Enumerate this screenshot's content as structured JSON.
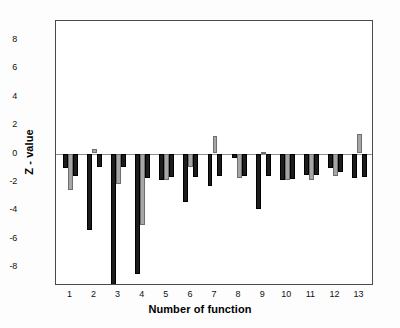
{
  "axes": {
    "xlabel": "Number of function",
    "ylabel": "Z - value",
    "yticks": [
      8,
      6,
      4,
      2,
      0,
      -2,
      -4,
      -6,
      -8
    ],
    "ytick_labels": [
      "8",
      "6",
      "4",
      "2",
      "0",
      "-2",
      "-4",
      "-6",
      "-8"
    ],
    "xticks": [
      1,
      2,
      3,
      4,
      5,
      6,
      7,
      8,
      9,
      10,
      11,
      12,
      13
    ],
    "xtick_labels": [
      "1",
      "2",
      "3",
      "4",
      "5",
      "6",
      "7",
      "8",
      "9",
      "10",
      "11",
      "12",
      "13"
    ]
  },
  "colors": {
    "series_1": "#1c1c1c",
    "series_2": "#a6a6a6",
    "series_3": "#1c1c1c",
    "axis": "#4a4a4a",
    "zero_line": "#8d8d8d",
    "background": "#ffffff"
  },
  "chart_data": {
    "type": "bar",
    "title": "",
    "xlabel": "Number of function",
    "ylabel": "Z - value",
    "categories": [
      "1",
      "2",
      "3",
      "4",
      "5",
      "6",
      "7",
      "8",
      "9",
      "10",
      "11",
      "12",
      "13"
    ],
    "ylim": [
      -9.3,
      9.3
    ],
    "xlim": [
      0.4,
      13.6
    ],
    "grid": false,
    "legend": "none",
    "zero_reference_line": 0,
    "series": [
      {
        "name": "series 1",
        "color": "#1c1c1c",
        "values": [
          -1.0,
          -5.35,
          -9.35,
          -8.45,
          -1.85,
          -3.4,
          -2.25,
          -0.35,
          -3.9,
          -1.85,
          -1.5,
          -1.05,
          -1.7
        ]
      },
      {
        "name": "series 2",
        "color": "#a6a6a6",
        "values": [
          -2.55,
          0.3,
          -2.15,
          -5.0,
          -1.85,
          -0.95,
          1.25,
          -1.75,
          0.1,
          -1.85,
          -1.85,
          -1.55,
          1.4
        ]
      },
      {
        "name": "series 3",
        "color": "#1c1c1c",
        "values": [
          -1.6,
          -0.95,
          -0.95,
          -1.7,
          -1.65,
          -1.65,
          -1.55,
          -1.6,
          -1.6,
          -1.8,
          -1.5,
          -1.3,
          -1.65
        ]
      }
    ]
  }
}
